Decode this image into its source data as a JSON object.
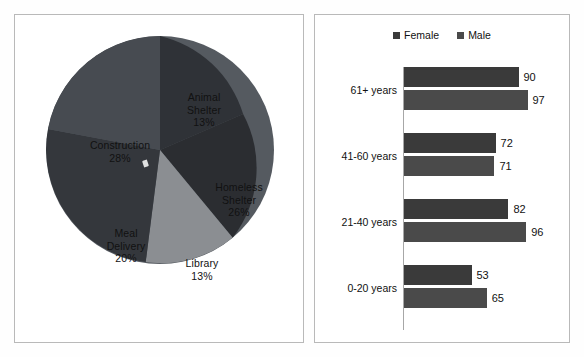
{
  "chart_data": [
    {
      "type": "pie",
      "title": "",
      "legend_position": "none",
      "categories": [
        "Animal Shelter",
        "Homeless Shelter",
        "Library",
        "Meal Delivery",
        "Construction"
      ],
      "values": [
        13,
        26,
        13,
        20,
        28
      ],
      "value_unit": "%",
      "labels": [
        {
          "name": "Animal Shelter",
          "line1": "Animal",
          "line2": "Shelter",
          "percent": "13%",
          "value": 13,
          "color": "#2f3237"
        },
        {
          "name": "Homeless Shelter",
          "line1": "Homeless",
          "line2": "Shelter",
          "percent": "26%",
          "value": 26,
          "color": "#2b2d31"
        },
        {
          "name": "Library",
          "line1": "Library",
          "line2": "",
          "percent": "13%",
          "value": 13,
          "color": "#8b8e92"
        },
        {
          "name": "Meal Delivery",
          "line1": "Meal",
          "line2": "Delivery",
          "percent": "20%",
          "value": 20,
          "color": "#34373c"
        },
        {
          "name": "Construction",
          "line1": "Construction",
          "line2": "",
          "percent": "28%",
          "value": 28,
          "color": "#474b51"
        }
      ]
    },
    {
      "type": "bar",
      "orientation": "horizontal",
      "title": "",
      "xlabel": "",
      "ylabel": "",
      "grid": false,
      "legend_position": "top",
      "categories": [
        "61+ years",
        "41-60 years",
        "21-40 years",
        "0-20 years"
      ],
      "series": [
        {
          "name": "Female",
          "color": "#3a3a3a",
          "values": [
            90,
            72,
            82,
            53
          ]
        },
        {
          "name": "Male",
          "color": "#4a4a4a",
          "values": [
            97,
            71,
            96,
            65
          ]
        }
      ],
      "xlim": [
        0,
        110
      ]
    }
  ],
  "pie_panel": {
    "name": "pie-chart-panel",
    "slices": [
      {
        "label_line1": "Animal",
        "label_line2": "Shelter",
        "percent": "13%"
      },
      {
        "label_line1": "Homeless",
        "label_line2": "Shelter",
        "percent": "26%"
      },
      {
        "label_line1": "Library",
        "label_line2": "",
        "percent": "13%"
      },
      {
        "label_line1": "Meal",
        "label_line2": "Delivery",
        "percent": "20%"
      },
      {
        "label_line1": "Construction",
        "label_line2": "",
        "percent": "28%"
      }
    ]
  },
  "bar_panel": {
    "name": "bar-chart-panel",
    "legend": [
      {
        "label": "Female",
        "color": "#3a3a3a"
      },
      {
        "label": "Male",
        "color": "#4a4a4a"
      }
    ],
    "groups": [
      {
        "category": "61+ years",
        "bars": [
          {
            "series": "Female",
            "value": 90,
            "value_label": "90"
          },
          {
            "series": "Male",
            "value": 97,
            "value_label": "97"
          }
        ]
      },
      {
        "category": "41-60 years",
        "bars": [
          {
            "series": "Female",
            "value": 72,
            "value_label": "72"
          },
          {
            "series": "Male",
            "value": 71,
            "value_label": "71"
          }
        ]
      },
      {
        "category": "21-40 years",
        "bars": [
          {
            "series": "Female",
            "value": 82,
            "value_label": "82"
          },
          {
            "series": "Male",
            "value": 96,
            "value_label": "96"
          }
        ]
      },
      {
        "category": "0-20 years",
        "bars": [
          {
            "series": "Female",
            "value": 53,
            "value_label": "53"
          },
          {
            "series": "Male",
            "value": 65,
            "value_label": "65"
          }
        ]
      }
    ]
  },
  "colors": {
    "panel_border": "#b9b9b9",
    "axis_line": "#a7a7a7",
    "text": "#111111",
    "background": "#ffffff"
  }
}
